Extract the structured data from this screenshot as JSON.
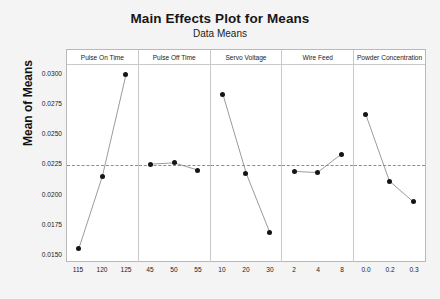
{
  "chart_data": {
    "type": "line",
    "title": "Main Effects Plot for Means",
    "subtitle": "Data Means",
    "ylabel": "Mean of Means",
    "xlabel": "",
    "ylim": [
      0.0145,
      0.0308
    ],
    "yticks": [
      "0.0300",
      "0.0275",
      "0.0250",
      "0.0225",
      "0.0200",
      "0.0175",
      "0.0150"
    ],
    "ytick_values": [
      0.03,
      0.0275,
      0.025,
      0.0225,
      0.02,
      0.0175,
      0.015
    ],
    "grid": false,
    "legend": "none",
    "reference_line": {
      "value": 0.0225,
      "style": "dashed",
      "label": "grand mean"
    },
    "panels": [
      {
        "name": "Pulse On Time",
        "categories": [
          "115",
          "120",
          "125"
        ],
        "values": [
          0.0156,
          0.0216,
          0.03
        ]
      },
      {
        "name": "Pulse Off Time",
        "categories": [
          "45",
          "50",
          "55"
        ],
        "values": [
          0.0226,
          0.0227,
          0.0221
        ]
      },
      {
        "name": "Servo Voltage",
        "categories": [
          "10",
          "20",
          "30"
        ],
        "values": [
          0.0284,
          0.0218,
          0.0169
        ]
      },
      {
        "name": "Wire Feed",
        "categories": [
          "2",
          "4",
          "8"
        ],
        "values": [
          0.022,
          0.0219,
          0.0234
        ]
      },
      {
        "name": "Powder Concentration",
        "categories": [
          "0.0",
          "0.2",
          "0.3"
        ],
        "values": [
          0.0267,
          0.0212,
          0.0195
        ]
      }
    ]
  },
  "colors": {
    "marker": "#151515",
    "line": "#8f8f8f",
    "reference": "#8d8d99",
    "frame": "#b9b9b9",
    "background": "#f4f4f4",
    "plot_background": "#ffffff"
  },
  "caption": ""
}
